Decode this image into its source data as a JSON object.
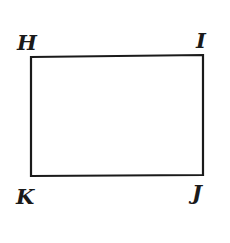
{
  "diagram": {
    "shape": "rectangle",
    "stroke_color": "#1a1a1a",
    "vertices": [
      {
        "label": "H",
        "position": "top-left"
      },
      {
        "label": "I",
        "position": "top-right"
      },
      {
        "label": "J",
        "position": "bottom-right"
      },
      {
        "label": "K",
        "position": "bottom-left"
      }
    ]
  }
}
